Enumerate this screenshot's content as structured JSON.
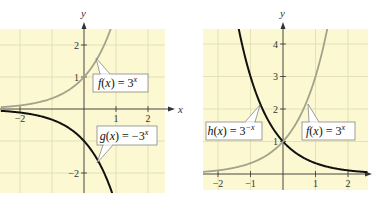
{
  "chart_data": [
    {
      "type": "line",
      "title": "",
      "xlabel": "x",
      "ylabel": "y",
      "xlim": [
        -2.6,
        2.55
      ],
      "ylim": [
        -2.6,
        2.5
      ],
      "grid": true,
      "background": "#fbf8d2",
      "x_ticks": [
        "-2",
        "1",
        "2"
      ],
      "y_ticks": [
        "2",
        "1",
        "-2"
      ],
      "series": [
        {
          "name": "f(x) = 3^x",
          "label_func": "f(x) = 3",
          "label_exp": "x",
          "color": "#a3a28c",
          "formula": "3^x",
          "points": [
            [
              -2.6,
              0.06
            ],
            [
              -2,
              0.11
            ],
            [
              -1,
              0.33
            ],
            [
              0,
              1
            ],
            [
              0.5,
              1.73
            ],
            [
              0.83,
              2.5
            ]
          ]
        },
        {
          "name": "g(x) = -3^x",
          "label_func": "g(x) = −3",
          "label_exp": "x",
          "color": "#111111",
          "formula": "-3^x",
          "points": [
            [
              -2.6,
              -0.06
            ],
            [
              -2,
              -0.11
            ],
            [
              -1,
              -0.33
            ],
            [
              0,
              -1
            ],
            [
              0.5,
              -1.73
            ],
            [
              0.83,
              -2.5
            ]
          ]
        }
      ]
    },
    {
      "type": "line",
      "title": "",
      "xlabel": "",
      "ylabel": "y",
      "xlim": [
        -2.5,
        2.6
      ],
      "ylim": [
        -0.5,
        4.5
      ],
      "grid": true,
      "background": "#fbf8d2",
      "x_ticks": [
        "-2",
        "-1",
        "1",
        "2"
      ],
      "y_ticks": [
        "4",
        "3",
        "2",
        "1"
      ],
      "series": [
        {
          "name": "h(x) = 3^-x",
          "label_func": "h(x) = 3",
          "label_exp": "−x",
          "color": "#111111",
          "formula": "3^-x",
          "points": [
            [
              -1.37,
              4.5
            ],
            [
              -1,
              3
            ],
            [
              -0.5,
              1.73
            ],
            [
              0,
              1
            ],
            [
              1,
              0.33
            ],
            [
              2,
              0.11
            ],
            [
              2.6,
              0.06
            ]
          ]
        },
        {
          "name": "f(x) = 3^x",
          "label_func": "f(x) = 3",
          "label_exp": "x",
          "color": "#a3a28c",
          "formula": "3^x",
          "points": [
            [
              -2.5,
              0.06
            ],
            [
              -2,
              0.11
            ],
            [
              -1,
              0.33
            ],
            [
              0,
              1
            ],
            [
              0.5,
              1.73
            ],
            [
              1,
              3
            ],
            [
              1.37,
              4.5
            ]
          ]
        }
      ]
    }
  ]
}
